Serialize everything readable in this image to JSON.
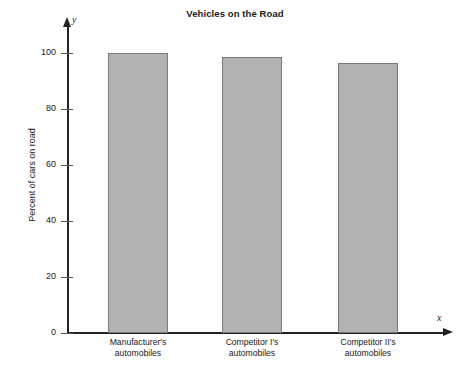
{
  "chart_data": {
    "type": "bar",
    "title": "Vehicles on the Road",
    "xlabel": "x",
    "ylabel": "Percent of cars on road",
    "categories": [
      "Manufacturer's automobiles",
      "Competitor I's automobiles",
      "Competitor II's automobiles"
    ],
    "category_lines": [
      [
        "Manufacturer's",
        "automobiles"
      ],
      [
        "Competitor I's",
        "automobiles"
      ],
      [
        "Competitor II's",
        "automobiles"
      ]
    ],
    "values": [
      100,
      98.5,
      96.5
    ],
    "ylim": [
      0,
      108
    ],
    "yticks": [
      0,
      20,
      40,
      60,
      80,
      100
    ],
    "ytick_labels": [
      "0",
      "20",
      "40",
      "60",
      "80",
      "100"
    ],
    "grid": false,
    "legend": false,
    "axis_letters": {
      "y": "y",
      "x": "x"
    },
    "colors": {
      "bar_fill": "#b2b2b2",
      "bar_border": "#7a7a7a",
      "axis": "#222222",
      "text": "#1a1a1a",
      "background": "#ffffff"
    }
  }
}
